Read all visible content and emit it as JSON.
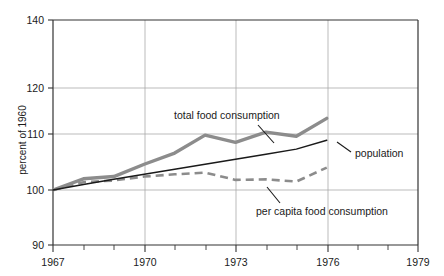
{
  "chart_data": {
    "type": "line",
    "title": "",
    "xlabel": "",
    "ylabel": "percent of 1960",
    "xlim": [
      1967,
      1979
    ],
    "ylim": [
      90,
      140
    ],
    "grid": true,
    "legend_position": "inline-annotations",
    "y_ticks": [
      90,
      100,
      110,
      120,
      140
    ],
    "y_tick_labels": [
      "90",
      "100",
      "110",
      "120",
      "140"
    ],
    "x_ticks": [
      1967,
      1970,
      1973,
      1976,
      1979
    ],
    "x_tick_labels": [
      "1967",
      "1970",
      "1973",
      "1976",
      "1979"
    ],
    "x_minor_ticks": [
      1968,
      1969,
      1971,
      1972,
      1974,
      1975,
      1977,
      1978
    ],
    "x": [
      1967,
      1968,
      1969,
      1970,
      1971,
      1972,
      1973,
      1974,
      1975,
      1976
    ],
    "series": [
      {
        "name": "total food consumption",
        "style": "solid-thick",
        "color": "#8c8c8c",
        "values": [
          100.0,
          102.0,
          102.4,
          104.6,
          106.6,
          109.8,
          108.5,
          110.4,
          109.6,
          113.4
        ]
      },
      {
        "name": "population",
        "style": "solid-thin",
        "color": "#1a1a1a",
        "values": [
          100.0,
          101.0,
          101.9,
          102.8,
          103.7,
          104.6,
          105.5,
          106.4,
          107.3,
          108.9
        ]
      },
      {
        "name": "per capita food consumption",
        "style": "dashed",
        "color": "#8c8c8c",
        "values": [
          100.0,
          101.4,
          101.7,
          102.4,
          102.8,
          103.1,
          101.8,
          101.9,
          101.5,
          104.0
        ]
      }
    ],
    "annotations": [
      {
        "text": "total food consumption",
        "target_series": "total food consumption"
      },
      {
        "text": "population",
        "target_series": "population"
      },
      {
        "text": "per capita food consumption",
        "target_series": "per capita food consumption"
      }
    ]
  },
  "axis": {
    "y_title": "percent of 1960"
  },
  "annotations": {
    "total": "total food consumption",
    "population": "population",
    "per_capita": "per capita food consumption"
  },
  "ticks": {
    "y": [
      "140",
      "120",
      "110",
      "100",
      "90"
    ],
    "x": [
      "1967",
      "1970",
      "1973",
      "1976",
      "1979"
    ]
  },
  "colors": {
    "gray_series": "#8c8c8c",
    "black_series": "#1a1a1a",
    "grid": "#aaaaaa",
    "frame": "#333333",
    "background": "#ffffff"
  }
}
